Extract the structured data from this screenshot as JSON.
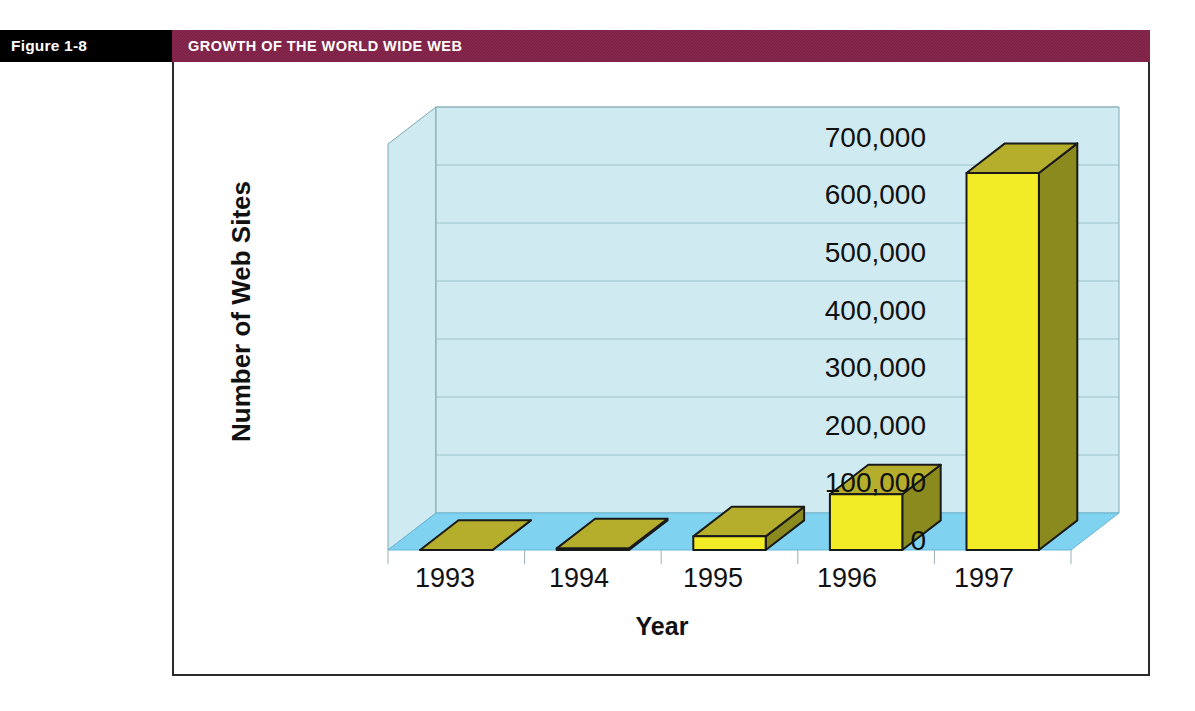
{
  "figure": {
    "tag": "Figure 1-8",
    "title": "GROWTH OF THE WORLD WIDE WEB",
    "tag_bg": "#000000",
    "title_bg": "#7d1d43",
    "title_fg": "#ffffff"
  },
  "chart_data": {
    "type": "bar",
    "title": "GROWTH OF THE WORLD WIDE WEB",
    "xlabel": "Year",
    "ylabel": "Number of Web Sites",
    "categories": [
      "1993",
      "1994",
      "1995",
      "1996",
      "1997"
    ],
    "values": [
      130,
      2738,
      23500,
      96000,
      650000
    ],
    "ylim": [
      0,
      700000
    ],
    "ytick_labels": [
      "700,000",
      "600,000",
      "500,000",
      "400,000",
      "300,000",
      "200,000",
      "100,000",
      "0"
    ],
    "ytick_values": [
      700000,
      600000,
      500000,
      400000,
      300000,
      200000,
      100000,
      0
    ],
    "grid": true,
    "legend": false,
    "style": "3d-column",
    "series": [
      {
        "name": "Number of Web Sites",
        "values": [
          130,
          2738,
          23500,
          96000,
          650000
        ]
      }
    ],
    "colors": {
      "bar_front": "#f2ec27",
      "bar_side": "#8a8a1f",
      "bar_top": "#b5ae2c",
      "bar_outline": "#1a1a1a",
      "wall_back": "#cfeaf0",
      "wall_side": "#cfeaf0",
      "floor": "#7fd2f0",
      "gridline": "#8ab3bd"
    }
  }
}
